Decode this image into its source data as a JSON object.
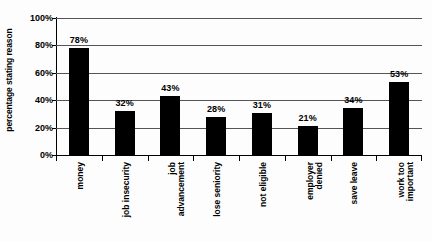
{
  "chart_data": {
    "type": "bar",
    "title": "",
    "xlabel": "",
    "ylabel": "percentage stating reason",
    "ylim": [
      0,
      100
    ],
    "grid": true,
    "legend": "none",
    "orientation": "vertical",
    "bar_color": "#000000",
    "categories": [
      "money",
      "job insecurity",
      "job advancement",
      "lose seniority",
      "not eligible",
      "employer denied",
      "save leave",
      "work too important"
    ],
    "category_lines": [
      [
        "money"
      ],
      [
        "job insecurity"
      ],
      [
        "job",
        "advancement"
      ],
      [
        "lose seniority"
      ],
      [
        "not eligible"
      ],
      [
        "employer",
        "denied"
      ],
      [
        "save leave"
      ],
      [
        "work too",
        "important"
      ]
    ],
    "values": [
      78,
      32,
      43,
      28,
      31,
      21,
      34,
      53
    ],
    "value_labels": [
      "78%",
      "32%",
      "43%",
      "28%",
      "31%",
      "21%",
      "34%",
      "53%"
    ],
    "y_ticks": [
      0,
      20,
      40,
      60,
      80,
      100
    ],
    "y_tick_labels": [
      "0%",
      "20%",
      "40%",
      "60%",
      "80%",
      "100%"
    ]
  }
}
